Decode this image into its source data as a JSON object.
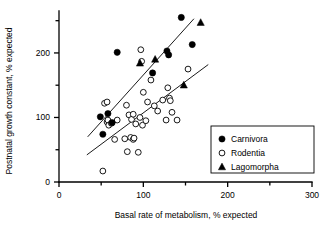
{
  "chart_data": {
    "type": "scatter",
    "title": "",
    "xlabel": "Basal rate of metabolism, % expected",
    "ylabel": "Postnatal growth constant, % expected",
    "xlim": [
      0,
      300
    ],
    "ylim": [
      0,
      265
    ],
    "xticks": [
      0,
      100,
      200,
      300
    ],
    "xtick_labels": [
      "0",
      "100",
      "200",
      "300"
    ],
    "xminor_ticks": [
      50,
      150,
      250
    ],
    "yticks": [
      0,
      100,
      200
    ],
    "ytick_labels": [
      "0",
      "100",
      "200"
    ],
    "yminor_ticks": [
      50,
      150,
      250
    ],
    "grid": false,
    "legend_position": "bottom-right",
    "legend_entries": [
      {
        "label": "Carnivora",
        "marker": "filled-circle"
      },
      {
        "label": "Rodentia",
        "marker": "open-circle"
      },
      {
        "label": "Lagomorpha",
        "marker": "filled-triangle"
      }
    ],
    "series": [
      {
        "name": "Carnivora",
        "marker": "filled-circle",
        "points": [
          [
            49,
            101
          ],
          [
            52,
            74
          ],
          [
            58,
            106
          ],
          [
            63,
            92
          ],
          [
            69,
            201
          ],
          [
            111,
            169
          ],
          [
            128,
            203
          ],
          [
            130,
            197
          ],
          [
            145,
            255
          ],
          [
            158,
            213
          ]
        ]
      },
      {
        "name": "Rodentia",
        "marker": "open-circle",
        "points": [
          [
            52,
            17
          ],
          [
            54,
            122
          ],
          [
            57,
            124
          ],
          [
            57,
            93
          ],
          [
            58,
            96
          ],
          [
            59,
            88
          ],
          [
            62,
            91
          ],
          [
            66,
            66
          ],
          [
            69,
            96
          ],
          [
            78,
            67
          ],
          [
            80,
            119
          ],
          [
            81,
            47
          ],
          [
            83,
            104
          ],
          [
            85,
            69
          ],
          [
            86,
            97
          ],
          [
            88,
            105
          ],
          [
            88,
            66
          ],
          [
            89,
            68
          ],
          [
            91,
            90
          ],
          [
            94,
            46
          ],
          [
            96,
            100
          ],
          [
            97,
            205
          ],
          [
            98,
            187
          ],
          [
            99,
            88
          ],
          [
            100,
            139
          ],
          [
            103,
            95
          ],
          [
            105,
            124
          ],
          [
            109,
            158
          ],
          [
            113,
            118
          ],
          [
            117,
            110
          ],
          [
            123,
            127
          ],
          [
            127,
            96
          ],
          [
            129,
            146
          ],
          [
            131,
            130
          ],
          [
            132,
            126
          ],
          [
            134,
            108
          ],
          [
            140,
            96
          ],
          [
            153,
            175
          ]
        ]
      },
      {
        "name": "Lagomorpha",
        "marker": "filled-triangle",
        "points": [
          [
            96,
            184
          ],
          [
            114,
            190
          ],
          [
            148,
            150
          ],
          [
            168,
            247
          ]
        ]
      }
    ],
    "fit_lines": [
      {
        "name": "upper-fit",
        "x1": 34,
        "y1": 70,
        "x2": 160,
        "y2": 253
      },
      {
        "name": "lower-fit",
        "x1": 33,
        "y1": 42,
        "x2": 177,
        "y2": 182
      }
    ]
  }
}
